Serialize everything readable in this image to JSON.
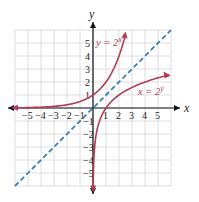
{
  "chart_data": {
    "type": "line",
    "title": "",
    "xlabel": "x",
    "ylabel": "y",
    "xlim": [
      -6,
      6
    ],
    "ylim": [
      -6,
      6
    ],
    "grid": true,
    "x_ticks": [
      "-5",
      "-4",
      "-3",
      "-2",
      "-1",
      "1",
      "2",
      "3",
      "4",
      "5"
    ],
    "y_ticks": [
      "5",
      "4",
      "3",
      "2",
      "1",
      "-1",
      "-2",
      "-3",
      "-4",
      "-5"
    ],
    "series": [
      {
        "name": "y = 2^x",
        "label": "y = 2",
        "label_exp": "x",
        "color": "#b33a55",
        "style": "solid",
        "points": [
          [
            -6,
            0.016
          ],
          [
            -5,
            0.031
          ],
          [
            -4,
            0.063
          ],
          [
            -3,
            0.125
          ],
          [
            -2,
            0.25
          ],
          [
            -1,
            0.5
          ],
          [
            0,
            1
          ],
          [
            1,
            2
          ],
          [
            2,
            4
          ],
          [
            2.5,
            5.66
          ]
        ]
      },
      {
        "name": "x = 2^y",
        "label": "x = 2",
        "label_exp": "y",
        "color": "#b33a55",
        "style": "solid",
        "points": [
          [
            0.016,
            -6
          ],
          [
            0.031,
            -5
          ],
          [
            0.063,
            -4
          ],
          [
            0.125,
            -3
          ],
          [
            0.25,
            -2
          ],
          [
            0.5,
            -1
          ],
          [
            1,
            0
          ],
          [
            2,
            1
          ],
          [
            4,
            2
          ],
          [
            5.66,
            2.5
          ]
        ]
      },
      {
        "name": "y = x",
        "label": "",
        "color": "#3b7fb8",
        "style": "dashed",
        "points": [
          [
            -6,
            -6
          ],
          [
            6,
            6
          ]
        ]
      }
    ]
  }
}
